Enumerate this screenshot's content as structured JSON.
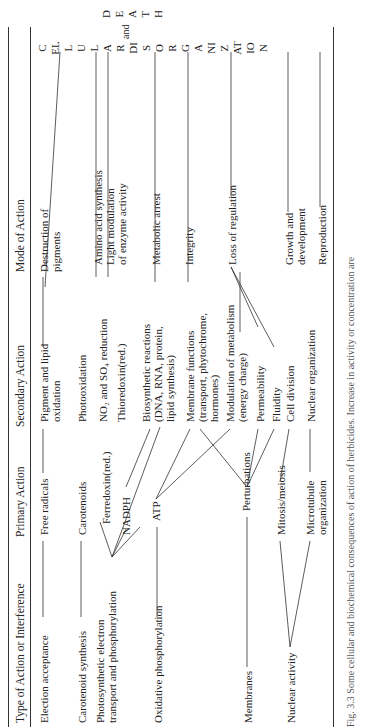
{
  "headers": [
    "Type of Action or Interference",
    "Primary Action",
    "Secondary Action",
    "Mode of Action"
  ],
  "col1": [
    "Election acceptance",
    "Carotenoid synthesis",
    "Photosynthetic electron",
    "transport and phosphorylation",
    "Oxidative phosphorylation",
    "Membranes",
    "Nuclear activity"
  ],
  "col2": [
    "Free radicals",
    "Carotenoids",
    "Ferredoxin(red.)",
    "NADPH",
    "ATP",
    "Perturbations",
    "Mitosis/meiosis",
    "Microtubule",
    "organization"
  ],
  "col3": [
    "Pigment and lipid",
    "oxidation",
    "Photooxidation",
    "NO₂ and SO₄ reduction",
    "Thioredoxin(red.)",
    "Biosynthetic reactions",
    "(DNA, RNA, protein,",
    "lipid synthesis)",
    "Membrane functions",
    "(transport, phytochrome,",
    "hormones)",
    "Modulation of metabolism",
    "(energy charge)",
    "Permeability",
    "Fluidity",
    "Cell division",
    "Nuclear organization"
  ],
  "col4": [
    "Destruction of",
    "pigments",
    "Amino acid synthesis",
    "Light modulation",
    "of enzyme activity",
    "Metabolic arrest",
    "Integrity",
    "Loss of regulation",
    "Growth and",
    "development",
    "Reproduction"
  ],
  "outcome": {
    "cellular": "CELLULAR DISORGANIZATION",
    "and": "and",
    "death": "DEATH"
  },
  "caption": "Fig. 3.3  Some cellular and biochemical consequences of action of herbicides. Increase in activity or concentration are"
}
